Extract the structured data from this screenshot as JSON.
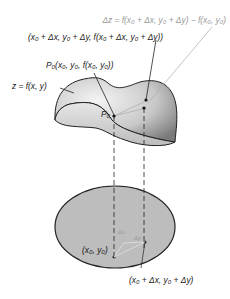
{
  "diagram": {
    "labels": {
      "delta_z": "Δz = f(x₀ + Δx, y₀ + Δy) − f(x₀, y₀)",
      "point_q": "(x₀ + Δx, y₀ + Δy, f(x₀ + Δx, y₀ + Δy))",
      "point_p0_full": "P₀(x₀, y₀, f(x₀, y₀))",
      "surface": "z = f(x, y)",
      "p0_short": "P₀",
      "base_point": "(x₀, y₀)",
      "base_point_shifted": "(x₀ + Δx, y₀ + Δy)",
      "delta_x": "Δx",
      "delta_y": "Δy"
    },
    "colors": {
      "surface_light": "#f2f2f2",
      "surface_dark": "#8a8a8a",
      "domain_fill": "#bdbdbd",
      "outline": "#222222",
      "gray_text": "#9a9a9a"
    }
  }
}
